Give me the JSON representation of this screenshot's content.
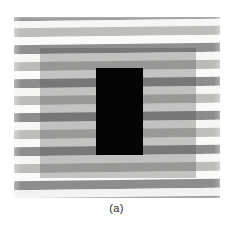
{
  "figure": {
    "caption": "(a)",
    "kind": "visual-illusion-stimulus"
  },
  "canvas": {
    "width": 233,
    "height": 229,
    "background": "#ffffff"
  },
  "stimulus": {
    "left": 14,
    "top": 17,
    "width": 206,
    "height": 181,
    "background": "#f2f2f0"
  },
  "palette": {
    "dark_stripe": "#8c8c8c",
    "mid_stripe": "#b8b8b6",
    "light_stripe": "#f4f4f2",
    "very_light_stripe": "#fafaf8",
    "overlay_fill": "rgba(70, 70, 70, 0.30)",
    "black_rect": "#050505",
    "caption_color": "#2b2b2b",
    "page_background": "#ffffff"
  },
  "stripes": [
    {
      "top": 0,
      "height": 9,
      "color": "#8a8a8a"
    },
    {
      "top": 9,
      "height": 7,
      "color": "#f6f6f4"
    },
    {
      "top": 16,
      "height": 9,
      "color": "#bdbdbb"
    },
    {
      "top": 25,
      "height": 8,
      "color": "#fafaf8"
    },
    {
      "top": 33,
      "height": 9,
      "color": "#8f8f8f"
    },
    {
      "top": 42,
      "height": 8,
      "color": "#f6f6f4"
    },
    {
      "top": 50,
      "height": 9,
      "color": "#bbbbb9"
    },
    {
      "top": 59,
      "height": 8,
      "color": "#fafaf8"
    },
    {
      "top": 67,
      "height": 9,
      "color": "#8d8d8d"
    },
    {
      "top": 76,
      "height": 8,
      "color": "#f6f6f4"
    },
    {
      "top": 84,
      "height": 9,
      "color": "#bcbcba"
    },
    {
      "top": 93,
      "height": 8,
      "color": "#fafaf8"
    },
    {
      "top": 101,
      "height": 9,
      "color": "#8c8c8c"
    },
    {
      "top": 110,
      "height": 8,
      "color": "#f6f6f4"
    },
    {
      "top": 118,
      "height": 9,
      "color": "#bdbdbb"
    },
    {
      "top": 127,
      "height": 8,
      "color": "#fafaf8"
    },
    {
      "top": 135,
      "height": 9,
      "color": "#8e8e8e"
    },
    {
      "top": 144,
      "height": 8,
      "color": "#f6f6f4"
    },
    {
      "top": 152,
      "height": 9,
      "color": "#bcbcba"
    },
    {
      "top": 161,
      "height": 8,
      "color": "#fafaf8"
    },
    {
      "top": 169,
      "height": 9,
      "color": "#8d8d8d"
    },
    {
      "top": 178,
      "height": 8,
      "color": "#f2f2f0"
    },
    {
      "top": 186,
      "height": 7,
      "color": "#8f8f8f"
    }
  ],
  "overlay_rect": {
    "left": 26,
    "top": 31,
    "width": 156,
    "height": 130,
    "fill": "rgba(70, 70, 70, 0.30)"
  },
  "black_rect": {
    "left": 82,
    "top": 51,
    "width": 47,
    "height": 87,
    "fill": "#050505"
  }
}
